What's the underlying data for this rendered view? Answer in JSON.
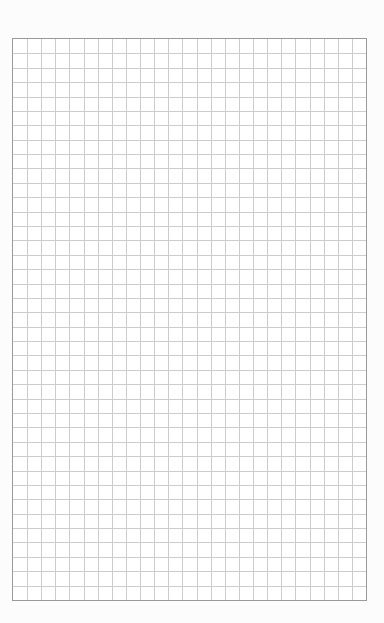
{
  "sheet": {
    "type": "graph-paper",
    "columns": 25,
    "rows": 39,
    "grid_left": 12,
    "grid_top": 38,
    "grid_width": 355,
    "grid_height": 563,
    "colors": {
      "page": "#fcfcfc",
      "paper": "#ffffff",
      "border": "#9a9a9a",
      "gridline": "#cccccc"
    }
  }
}
